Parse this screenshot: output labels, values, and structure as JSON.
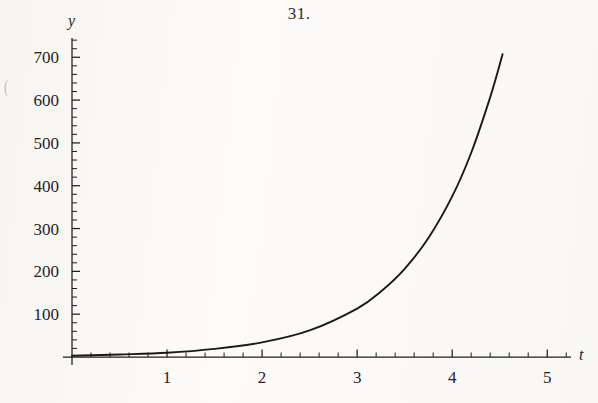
{
  "title": "31.",
  "edge_artifact": "(",
  "chart_data": {
    "type": "line",
    "title": "31.",
    "xlabel": "t",
    "ylabel": "y",
    "xlim": [
      0,
      5.25
    ],
    "ylim": [
      0,
      745
    ],
    "grid": false,
    "legend": null,
    "axis_style": "single-quadrant-open-axes",
    "line_color": "#1b1a19",
    "background_color": "#fbfaf8",
    "x_ticks_major": [
      1,
      2,
      3,
      4,
      5
    ],
    "x_tick_labels": [
      "1",
      "2",
      "3",
      "4",
      "5"
    ],
    "x_minor_step": 0.2,
    "y_ticks_major": [
      100,
      200,
      300,
      400,
      500,
      600,
      700
    ],
    "y_tick_labels": [
      "100",
      "200",
      "300",
      "400",
      "500",
      "600",
      "700"
    ],
    "y_minor_step": 20,
    "curve_label": "exponential growth",
    "approx_equation": "y = 3.1 e^(1.2 t)",
    "x_range_drawn": [
      0,
      4.53
    ],
    "points": [
      {
        "t": 0.0,
        "y": 3
      },
      {
        "t": 0.5,
        "y": 6
      },
      {
        "t": 1.0,
        "y": 10
      },
      {
        "t": 1.5,
        "y": 19
      },
      {
        "t": 2.0,
        "y": 34
      },
      {
        "t": 2.5,
        "y": 62
      },
      {
        "t": 3.0,
        "y": 113
      },
      {
        "t": 3.25,
        "y": 153
      },
      {
        "t": 3.5,
        "y": 206
      },
      {
        "t": 3.75,
        "y": 278
      },
      {
        "t": 4.0,
        "y": 375
      },
      {
        "t": 4.2,
        "y": 477
      },
      {
        "t": 4.4,
        "y": 607
      },
      {
        "t": 4.53,
        "y": 707
      }
    ]
  }
}
